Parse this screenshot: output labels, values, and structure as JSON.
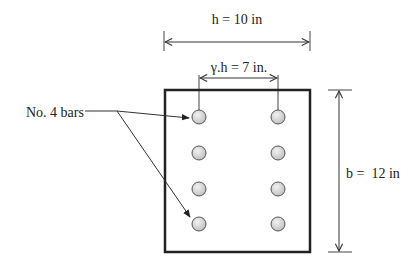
{
  "diagram": {
    "type": "rectangular beam cross-section with reinforcement",
    "labels": {
      "width_dimension": "h = 10 in",
      "bar_spacing_dimension": "γ.h = 7 in.",
      "height_dimension": "b =  12 in",
      "bar_callout": "No. 4 bars"
    },
    "section": {
      "outline_color": "#222222",
      "bar_fill": "#d4d4d4",
      "bar_stroke": "#555555",
      "bar_columns": 2,
      "bar_rows": 4,
      "total_bars": 8
    }
  }
}
